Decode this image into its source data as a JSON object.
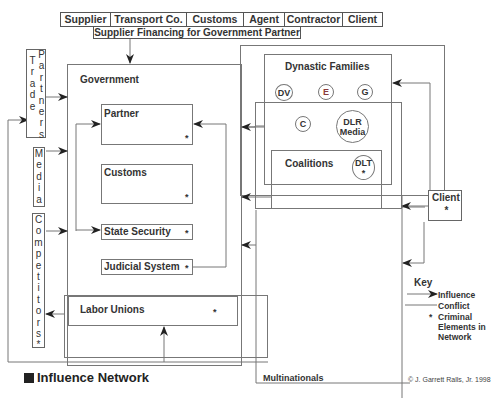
{
  "top_bar": {
    "items": [
      "Supplier",
      "Transport Co.",
      "Customs",
      "Agent",
      "Contractor",
      "Client"
    ],
    "financing_label": "Supplier Financing for Government Partner"
  },
  "left_column": {
    "trade_partners_line1": "Trade",
    "trade_partners_line2": "Partners",
    "media": "Media",
    "competitors": "Competitors*"
  },
  "government": {
    "title": "Government",
    "partner": "Partner",
    "customs": "Customs",
    "state_security": "State Security",
    "judicial_system": "Judicial System",
    "labor_unions": "Labor Unions",
    "criminal_marker": "*"
  },
  "dynastic_families": {
    "title": "Dynastic Families",
    "members": {
      "dv": "DV",
      "e": "E",
      "g": "G",
      "c": "C",
      "dlr_media_line1": "DLR",
      "dlr_media_line2": "Media",
      "dlt": "DLT"
    },
    "coalitions": "Coalitions",
    "e_color": "#8a3a3a"
  },
  "client": {
    "label": "Client",
    "marker": "*"
  },
  "multinationals": "Multinationals",
  "key": {
    "title": "Key",
    "influence": "Influence",
    "conflict": "Conflict",
    "criminal_marker": "*",
    "criminal_line1": "Criminal",
    "criminal_line2": "Elements in",
    "criminal_line3": "Network"
  },
  "caption": "Influence Network",
  "copyright": "© J. Garrett Ralls, Jr. 1998"
}
